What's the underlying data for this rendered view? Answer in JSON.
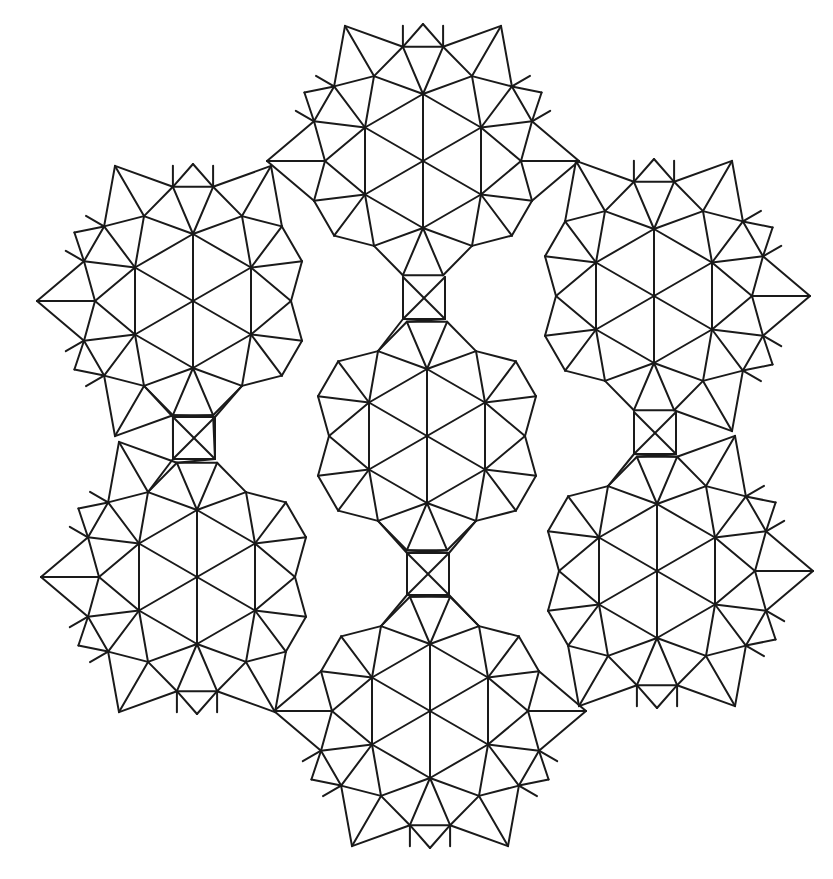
{
  "figure": {
    "title": "Rosette triangle–square tiling line drawing",
    "width": 833,
    "height": 879,
    "background": "#ffffff",
    "stroke_color": "#1a1a1a",
    "stroke_width": 2,
    "global_center": [
      427,
      436
    ],
    "boundary_threshold": 285
  },
  "rosette_geometry": {
    "hex_radius": 67,
    "mid_radius": 98,
    "flank_radius": 116,
    "flank_angle_offset_deg": 10,
    "tip_radius": 137,
    "corner_radius": 156,
    "spike_length": 21
  },
  "rosettes": [
    {
      "name": "top",
      "center": [
        423,
        161
      ]
    },
    {
      "name": "upper-left",
      "center": [
        193,
        301
      ]
    },
    {
      "name": "upper-right",
      "center": [
        654,
        296
      ]
    },
    {
      "name": "central",
      "center": [
        427,
        436
      ]
    },
    {
      "name": "lower-left",
      "center": [
        197,
        577
      ]
    },
    {
      "name": "lower-right",
      "center": [
        657,
        571
      ]
    },
    {
      "name": "bottom",
      "center": [
        430,
        711
      ]
    }
  ],
  "x_squares": [
    {
      "name": "upper",
      "center": [
        424,
        298
      ],
      "half": 21
    },
    {
      "name": "right",
      "center": [
        655,
        433
      ],
      "half": 21
    },
    {
      "name": "lower",
      "center": [
        428,
        574
      ],
      "half": 21
    },
    {
      "name": "left",
      "center": [
        194,
        438
      ],
      "half": 21
    }
  ]
}
